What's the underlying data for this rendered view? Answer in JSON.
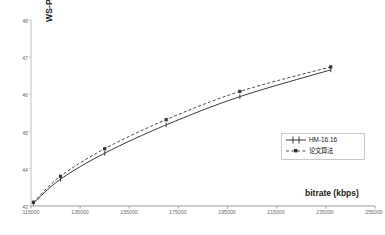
{
  "chart_data": {
    "type": "line",
    "title": "",
    "xlabel": "bitrate (kbps)",
    "ylabel": "WS-PSNR",
    "xlim": [
      115000,
      255000
    ],
    "ylim": [
      43,
      48
    ],
    "grid": false,
    "legend_position": "center-right",
    "x_ticks": [
      "115000",
      "135000",
      "155000",
      "175000",
      "195000",
      "215000",
      "235000",
      "255000"
    ],
    "x_tick_values": [
      115000,
      135000,
      155000,
      175000,
      195000,
      215000,
      235000,
      255000
    ],
    "y_ticks": [
      "48",
      "47",
      "46",
      "45",
      "44",
      "43"
    ],
    "y_tick_values": [
      48,
      47,
      46,
      45,
      44,
      43
    ],
    "series": [
      {
        "name": "HM-16.16",
        "style": "solid",
        "color": "#3a3a3a",
        "marker": "cross",
        "x": [
          116000,
          127000,
          145000,
          170000,
          200000,
          237000
        ],
        "y": [
          43.08,
          43.72,
          44.42,
          45.18,
          45.94,
          46.66
        ]
      },
      {
        "name": "论文算法",
        "style": "dashed",
        "color": "#4a4a4a",
        "marker": "square",
        "x": [
          116000,
          127000,
          145000,
          170000,
          200000,
          237000
        ],
        "y": [
          43.1,
          43.8,
          44.54,
          45.32,
          46.08,
          46.74
        ]
      }
    ]
  },
  "legend": {
    "entries": [
      {
        "label": "HM-16.16"
      },
      {
        "label": "论文算法"
      }
    ]
  },
  "axes": {
    "y_title": "WS-PSNR",
    "x_title": "bitrate (kbps)"
  }
}
